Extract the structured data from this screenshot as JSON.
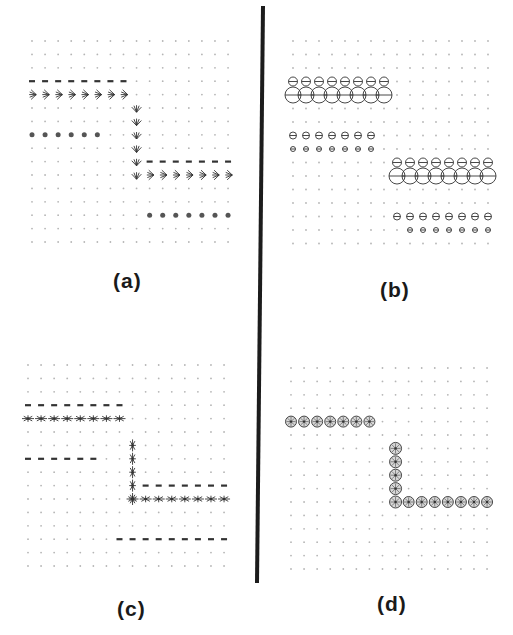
{
  "figure": {
    "divider": {
      "x1": 263,
      "y1": 6,
      "x2": 257,
      "y2": 583,
      "width": 4,
      "color": "#1c1c1c"
    },
    "ink_color": "#333333",
    "faint_color": "#b5b5b5"
  },
  "panels": [
    {
      "id": "a",
      "label": "(a)",
      "glyph_style": "arrow-fan",
      "grid": {
        "x0": 32,
        "y0": 41,
        "dx": 13.07,
        "dy": 13.4,
        "cols": 16,
        "rows": 16
      },
      "features": [
        {
          "type": "row-band",
          "row": 3,
          "cols": [
            0,
            7
          ],
          "glyph": "dash",
          "size": 3
        },
        {
          "type": "row-band",
          "row": 4,
          "cols": [
            0,
            7
          ],
          "glyph": "fan-left",
          "size": 7
        },
        {
          "type": "col-band",
          "col": 8,
          "rows": [
            5,
            10
          ],
          "glyph": "fan-up",
          "size": 7
        },
        {
          "type": "row-band",
          "row": 10,
          "cols": [
            9,
            15
          ],
          "glyph": "fan-left",
          "size": 7
        },
        {
          "type": "row-band",
          "row": 9,
          "cols": [
            9,
            15
          ],
          "glyph": "dash",
          "size": 3
        },
        {
          "type": "row-band",
          "row": 7,
          "cols": [
            0,
            5
          ],
          "glyph": "blob",
          "size": 2.5
        },
        {
          "type": "row-band",
          "row": 13,
          "cols": [
            9,
            15
          ],
          "glyph": "blob",
          "size": 2.5
        }
      ]
    },
    {
      "id": "b",
      "label": "(b)",
      "glyph_style": "ellipse",
      "grid": {
        "x0": 293,
        "y0": 41,
        "dx": 13.0,
        "dy": 13.5,
        "cols": 16,
        "rows": 16
      },
      "features": [
        {
          "type": "row-band",
          "row": 3,
          "cols": [
            0,
            7
          ],
          "glyph": "circle-bar",
          "size": 4.5
        },
        {
          "type": "row-band",
          "row": 4,
          "cols": [
            0,
            7
          ],
          "glyph": "circle-bar",
          "size": 8
        },
        {
          "type": "row-band",
          "row": 7,
          "cols": [
            0,
            6
          ],
          "glyph": "circle-bar",
          "size": 3.5
        },
        {
          "type": "row-band",
          "row": 8,
          "cols": [
            0,
            6
          ],
          "glyph": "circle-bar",
          "size": 2.5
        },
        {
          "type": "row-band",
          "row": 9,
          "cols": [
            8,
            15
          ],
          "glyph": "circle-bar",
          "size": 4.5
        },
        {
          "type": "row-band",
          "row": 10,
          "cols": [
            8,
            15
          ],
          "glyph": "circle-bar",
          "size": 8
        },
        {
          "type": "row-band",
          "row": 13,
          "cols": [
            8,
            15
          ],
          "glyph": "circle-bar",
          "size": 3.5
        },
        {
          "type": "row-band",
          "row": 14,
          "cols": [
            9,
            15
          ],
          "glyph": "circle-bar",
          "size": 2.5
        }
      ]
    },
    {
      "id": "c",
      "label": "(c)",
      "glyph_style": "star",
      "grid": {
        "x0": 28,
        "y0": 365,
        "dx": 13.07,
        "dy": 13.4,
        "cols": 16,
        "rows": 16
      },
      "features": [
        {
          "type": "row-band",
          "row": 3,
          "cols": [
            0,
            7
          ],
          "glyph": "dash",
          "size": 3
        },
        {
          "type": "row-band",
          "row": 4,
          "cols": [
            0,
            7
          ],
          "glyph": "star",
          "size": 6
        },
        {
          "type": "row-band",
          "row": 7,
          "cols": [
            0,
            5
          ],
          "glyph": "dash",
          "size": 3
        },
        {
          "type": "col-band",
          "col": 8,
          "rows": [
            6,
            10
          ],
          "glyph": "star-tall",
          "size": 6
        },
        {
          "type": "row-band",
          "row": 9,
          "cols": [
            9,
            15
          ],
          "glyph": "dash",
          "size": 3
        },
        {
          "type": "row-band",
          "row": 10,
          "cols": [
            8,
            15
          ],
          "glyph": "star",
          "size": 6
        },
        {
          "type": "row-band",
          "row": 13,
          "cols": [
            7,
            15
          ],
          "glyph": "dash",
          "size": 3
        }
      ]
    },
    {
      "id": "d",
      "label": "(d)",
      "glyph_style": "circle-star",
      "grid": {
        "x0": 291,
        "y0": 368,
        "dx": 13.07,
        "dy": 13.4,
        "cols": 16,
        "rows": 16
      },
      "features": [
        {
          "type": "row-band",
          "row": 4,
          "cols": [
            0,
            6
          ],
          "glyph": "circle-star",
          "size": 5.5
        },
        {
          "type": "col-band",
          "col": 8,
          "rows": [
            6,
            10
          ],
          "glyph": "circle-star",
          "size": 6
        },
        {
          "type": "row-band",
          "row": 10,
          "cols": [
            9,
            15
          ],
          "glyph": "circle-star",
          "size": 5.5
        }
      ]
    }
  ]
}
